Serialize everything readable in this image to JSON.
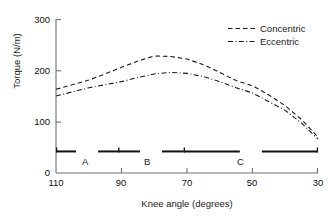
{
  "chart_data": {
    "type": "line",
    "title": "",
    "xlabel": "Knee angle (degrees)",
    "ylabel": "Torque (N/m)",
    "xlim": [
      110,
      30
    ],
    "ylim": [
      0,
      300
    ],
    "x_ticks": [
      110,
      90,
      70,
      50,
      30
    ],
    "y_ticks": [
      0,
      100,
      200,
      300
    ],
    "x_tick_labels": [
      "110",
      "90",
      "70",
      "50",
      "30"
    ],
    "y_tick_labels": [
      "0",
      "100",
      "200",
      "300"
    ],
    "grid": false,
    "legend_position": "top-right",
    "x": [
      110,
      105,
      100,
      95,
      90,
      85,
      80,
      75,
      70,
      65,
      60,
      55,
      50,
      45,
      40,
      35,
      30
    ],
    "series": [
      {
        "name": "Concentric",
        "linestyle": "dashed",
        "color": "#1a1a1a",
        "values": [
          163,
          172,
          181,
          193,
          206,
          218,
          228,
          227,
          222,
          211,
          196,
          180,
          170,
          152,
          131,
          104,
          70
        ]
      },
      {
        "name": "Eccentric",
        "linestyle": "dash-dot",
        "color": "#1a1a1a",
        "values": [
          150,
          158,
          166,
          172,
          178,
          186,
          193,
          196,
          194,
          188,
          178,
          166,
          156,
          139,
          122,
          97,
          66
        ]
      }
    ],
    "annotations": {
      "phase_bar_label": "Phase ranges along knee angle axis",
      "phase_bar_y_value": 42,
      "phases": [
        {
          "label": "A",
          "start": 110,
          "end": 91
        },
        {
          "label": "B",
          "start": 91,
          "end": 71
        },
        {
          "label": "C",
          "start": 71,
          "end": 30
        }
      ]
    }
  },
  "axes": {
    "y_label": "Torque (N/m)",
    "x_label": "Knee angle (degrees)",
    "y_ticks": [
      "300",
      "200",
      "100",
      "0"
    ],
    "x_ticks": [
      "110",
      "90",
      "70",
      "50",
      "30"
    ]
  },
  "legend": {
    "items": [
      {
        "label": "Concentric",
        "style": "dashed"
      },
      {
        "label": "Eccentric",
        "style": "dash-dot"
      }
    ]
  },
  "phase_markers": [
    {
      "label": "A"
    },
    {
      "label": "B"
    },
    {
      "label": "C"
    }
  ]
}
